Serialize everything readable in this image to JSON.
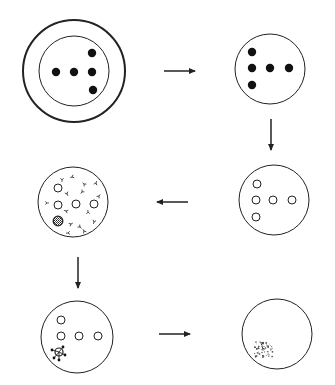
{
  "diagram": {
    "title": "",
    "stroke_color": "#222222",
    "panels": [
      {
        "id": "panel-1-initial",
        "description": "Outer ring around inner dish with five solid dots",
        "center": [
          74,
          71
        ],
        "outer_radius": 51,
        "inner_radius": 35,
        "solid_dots": [
          [
            56,
            72
          ],
          [
            74,
            72
          ],
          [
            92,
            72
          ],
          [
            92,
            53
          ],
          [
            93,
            90
          ]
        ]
      },
      {
        "id": "panel-2-isolated",
        "description": "Dish with five solid dots",
        "center": [
          270,
          69
        ],
        "radius": 35,
        "solid_dots": [
          [
            252,
            52
          ],
          [
            252,
            68
          ],
          [
            270,
            68
          ],
          [
            289,
            68
          ],
          [
            252,
            85
          ]
        ]
      },
      {
        "id": "panel-3-open",
        "description": "Dish with five open circles",
        "center": [
          274,
          200
        ],
        "radius": 35,
        "open_circles": [
          [
            257,
            184
          ],
          [
            256,
            200
          ],
          [
            273,
            200
          ],
          [
            292,
            200
          ],
          [
            256,
            217
          ]
        ]
      },
      {
        "id": "panel-4-antibody",
        "description": "Dish with open circles, one hatched circle and scattered Y-shaped markers",
        "center": [
          73,
          202
        ],
        "radius": 35,
        "open_circles": [
          [
            58,
            188
          ],
          [
            58,
            205
          ],
          [
            76,
            204
          ],
          [
            94,
            204
          ]
        ],
        "hatched_circles": [
          [
            58,
            221
          ]
        ],
        "y_markers": [
          [
            62,
            180
          ],
          [
            72,
            177
          ],
          [
            84,
            184
          ],
          [
            96,
            183
          ],
          [
            47,
            203
          ],
          [
            67,
            194
          ],
          [
            82,
            192
          ],
          [
            66,
            211
          ],
          [
            88,
            212
          ],
          [
            71,
            224
          ],
          [
            80,
            227
          ],
          [
            94,
            222
          ],
          [
            68,
            233
          ],
          [
            84,
            231
          ],
          [
            99,
            196
          ]
        ]
      },
      {
        "id": "panel-5-complement",
        "description": "Dish with open circles and one circle surrounded by complement dots",
        "center": [
          77,
          337
        ],
        "radius": 36,
        "open_circles": [
          [
            61,
            320
          ],
          [
            61,
            336
          ],
          [
            79,
            336
          ],
          [
            98,
            336
          ]
        ],
        "complement_circle": [
          59,
          352
        ]
      },
      {
        "id": "panel-6-lysed",
        "description": "Empty dish with debris cluster",
        "center": [
          277,
          334
        ],
        "radius": 35,
        "debris_center": [
          263,
          349
        ]
      }
    ],
    "arrows": [
      {
        "id": "arrow-1-right",
        "from": [
          164,
          71
        ],
        "to": [
          195,
          71
        ]
      },
      {
        "id": "arrow-2-down",
        "from": [
          271,
          119
        ],
        "to": [
          271,
          150
        ]
      },
      {
        "id": "arrow-3-left",
        "from": [
          188,
          202
        ],
        "to": [
          157,
          202
        ]
      },
      {
        "id": "arrow-4-down",
        "from": [
          78,
          257
        ],
        "to": [
          78,
          288
        ]
      },
      {
        "id": "arrow-5-right",
        "from": [
          159,
          334
        ],
        "to": [
          190,
          334
        ]
      }
    ]
  }
}
